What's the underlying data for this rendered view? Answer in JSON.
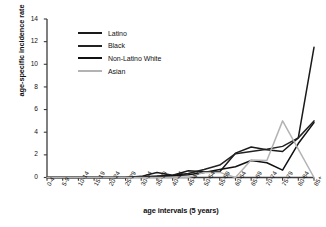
{
  "chart_data": {
    "type": "line",
    "title": "",
    "xlabel": "age intervals (5 years)",
    "ylabel": "age-specific incidence rate",
    "categories": [
      "0-4",
      "5-9",
      "10-14",
      "15-19",
      "20-24",
      "25-29",
      "30-34",
      "35-39",
      "40-44",
      "45-49",
      "50-54",
      "55-59",
      "60-64",
      "65-69",
      "70-74",
      "75-79",
      "80-84",
      "85+"
    ],
    "ylim": [
      0,
      14
    ],
    "yticks": [
      0,
      2,
      4,
      6,
      8,
      10,
      12,
      14
    ],
    "grid": false,
    "legend_position": "upper-left-inside",
    "series": [
      {
        "name": "Latino",
        "color": "#1a1a1a",
        "values": [
          0,
          0,
          0,
          0,
          0,
          0,
          0.1,
          0.45,
          0.2,
          0.6,
          0.5,
          0.5,
          2.15,
          2.7,
          2.45,
          2.3,
          3.5,
          11.5
        ]
      },
      {
        "name": "Black",
        "color": "#222222",
        "values": [
          0,
          0,
          0,
          0,
          0,
          0,
          0.05,
          0.1,
          0.2,
          0.35,
          0.7,
          1.1,
          2.1,
          2.3,
          2.5,
          2.75,
          3.5,
          5.0
        ]
      },
      {
        "name": "Non-Latino White",
        "color": "#111111",
        "values": [
          0,
          0,
          0,
          0,
          0,
          0,
          0.05,
          0.1,
          0.15,
          0.25,
          0.45,
          0.7,
          0.95,
          1.5,
          1.3,
          0.65,
          3.0,
          4.85
        ]
      },
      {
        "name": "Asian",
        "color": "#b3b3b3",
        "values": [
          0,
          0,
          0,
          0,
          0,
          0,
          0,
          0,
          0,
          0,
          0.45,
          0.45,
          0,
          1.55,
          1.5,
          5.0,
          2.5,
          0
        ]
      }
    ]
  }
}
